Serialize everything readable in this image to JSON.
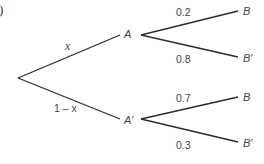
{
  "part_label": "(a)",
  "tree": {
    "root": {
      "children": [
        "A",
        "A'"
      ]
    },
    "first_stage": [
      {
        "node": "A",
        "node_label": "A",
        "edge_label": "x"
      },
      {
        "node": "A'",
        "node_label": "A′",
        "edge_label": "1 – x"
      }
    ],
    "second_stage": [
      {
        "parent": "A",
        "node_label": "B",
        "edge_label": "0.2"
      },
      {
        "parent": "A",
        "node_label": "B′",
        "edge_label": "0.8"
      },
      {
        "parent": "A'",
        "node_label": "B",
        "edge_label": "0.7"
      },
      {
        "parent": "A'",
        "node_label": "B′",
        "edge_label": "0.3"
      }
    ]
  },
  "colors": {
    "line": "#2b2b2b",
    "text": "#444444"
  }
}
